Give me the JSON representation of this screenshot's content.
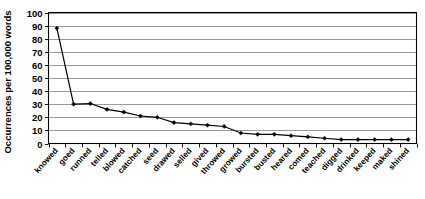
{
  "chart_data": {
    "type": "line",
    "title": "",
    "xlabel": "",
    "ylabel": "Occurrences per 100,000 words",
    "ylim": [
      0,
      100
    ],
    "ytick_step": 10,
    "yticks": [
      0,
      10,
      20,
      30,
      40,
      50,
      60,
      70,
      80,
      90,
      100
    ],
    "grid": true,
    "legend": "none",
    "marker": "filled-diamond",
    "line_color": "#000000",
    "grid_color": "#808080",
    "categories": [
      "knowed",
      "goed",
      "runned",
      "telled",
      "blowed",
      "catched",
      "seed",
      "drawed",
      "selled",
      "gived",
      "throwed",
      "growed",
      "bursted",
      "busted",
      "heared",
      "comed",
      "teached",
      "digged",
      "drinked",
      "keeped",
      "maked",
      "shined"
    ],
    "values": [
      88,
      30,
      30.5,
      26,
      24,
      21,
      20,
      16,
      15,
      14,
      13,
      8,
      7,
      7,
      6,
      5,
      4,
      3,
      3,
      3,
      3,
      3
    ],
    "series": [
      {
        "name": "Occurrences per 100,000 words",
        "values": [
          88,
          30,
          30.5,
          26,
          24,
          21,
          20,
          16,
          15,
          14,
          13,
          8,
          7,
          7,
          6,
          5,
          4,
          3,
          3,
          3,
          3,
          3
        ]
      }
    ]
  },
  "axis": {
    "y_axis_title": "Occurrences per 100,000 words"
  }
}
